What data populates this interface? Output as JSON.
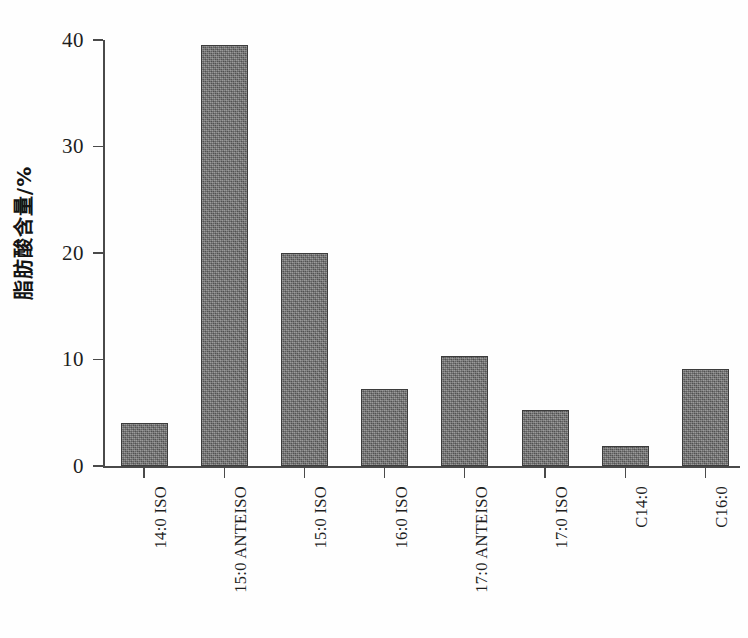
{
  "chart_data": {
    "type": "bar",
    "title": "",
    "xlabel": "",
    "ylabel": "脂肪酸含量/%",
    "ylim": [
      0,
      40
    ],
    "yticks": [
      "0",
      "10",
      "20",
      "30",
      "40"
    ],
    "ytick_values": [
      0,
      10,
      20,
      30,
      40
    ],
    "grid": false,
    "legend": null,
    "categories": [
      "14:0 ISO",
      "15:0 ANTEISO",
      "15:0 ISO",
      "16:0 ISO",
      "17:0 ANTEISO",
      "17:0 ISO",
      "C14:0",
      "C16:0"
    ],
    "values": [
      4.0,
      39.5,
      20.0,
      7.2,
      10.3,
      5.3,
      1.9,
      9.1
    ],
    "bar_color": "#6e6e6e",
    "bar_edge_color": "#3c3c3c",
    "axis_color": "#4a4a4a",
    "background": "#ffffff"
  },
  "artifacts": {
    "bottom_right": ""
  }
}
